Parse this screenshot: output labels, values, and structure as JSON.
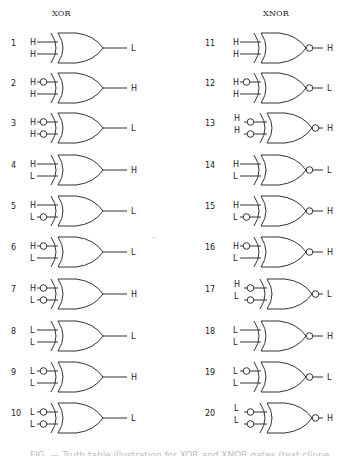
{
  "titles": {
    "left": "XOR",
    "right": "XNOR"
  },
  "style": {
    "stroke": "#333333",
    "text": "#222222"
  },
  "gates": [
    {
      "num": "1",
      "type": "XOR",
      "col": 0,
      "row": 0,
      "in1": "H",
      "in1_inv": false,
      "in2": "H",
      "in2_inv": false,
      "out": "L"
    },
    {
      "num": "2",
      "type": "XOR",
      "col": 0,
      "row": 1,
      "in1": "H",
      "in1_inv": true,
      "in2": "H",
      "in2_inv": false,
      "out": "H"
    },
    {
      "num": "3",
      "type": "XOR",
      "col": 0,
      "row": 2,
      "in1": "H",
      "in1_inv": true,
      "in2": "H",
      "in2_inv": true,
      "out": "L"
    },
    {
      "num": "4",
      "type": "XOR",
      "col": 0,
      "row": 3,
      "in1": "H",
      "in1_inv": false,
      "in2": "L",
      "in2_inv": false,
      "out": "H"
    },
    {
      "num": "5",
      "type": "XOR",
      "col": 0,
      "row": 4,
      "in1": "H",
      "in1_inv": false,
      "in2": "L",
      "in2_inv": true,
      "out": "L"
    },
    {
      "num": "6",
      "type": "XOR",
      "col": 0,
      "row": 5,
      "in1": "H",
      "in1_inv": true,
      "in2": "L",
      "in2_inv": false,
      "out": "L"
    },
    {
      "num": "7",
      "type": "XOR",
      "col": 0,
      "row": 6,
      "in1": "H",
      "in1_inv": true,
      "in2": "L",
      "in2_inv": true,
      "out": "H"
    },
    {
      "num": "8",
      "type": "XOR",
      "col": 0,
      "row": 7,
      "in1": "L",
      "in1_inv": false,
      "in2": "L",
      "in2_inv": false,
      "out": "L"
    },
    {
      "num": "9",
      "type": "XOR",
      "col": 0,
      "row": 8,
      "in1": "L",
      "in1_inv": true,
      "in2": "L",
      "in2_inv": false,
      "out": "H"
    },
    {
      "num": "10",
      "type": "XOR",
      "col": 0,
      "row": 9,
      "in1": "L",
      "in1_inv": true,
      "in2": "L",
      "in2_inv": true,
      "out": "L"
    },
    {
      "num": "11",
      "type": "XNOR",
      "col": 1,
      "row": 0,
      "in1": "H",
      "in1_inv": false,
      "in2": "H",
      "in2_inv": false,
      "out": "H"
    },
    {
      "num": "12",
      "type": "XNOR",
      "col": 1,
      "row": 1,
      "in1": "H",
      "in1_inv": true,
      "in2": "H",
      "in2_inv": false,
      "out": "L"
    },
    {
      "num": "13",
      "type": "XNOR",
      "col": 1,
      "row": 2,
      "in1": "H",
      "in1_inv": true,
      "in2": "H",
      "in2_inv": true,
      "out": "H",
      "shifted": true
    },
    {
      "num": "14",
      "type": "XNOR",
      "col": 1,
      "row": 3,
      "in1": "H",
      "in1_inv": false,
      "in2": "L",
      "in2_inv": false,
      "out": "L"
    },
    {
      "num": "15",
      "type": "XNOR",
      "col": 1,
      "row": 4,
      "in1": "H",
      "in1_inv": false,
      "in2": "L",
      "in2_inv": true,
      "out": "H"
    },
    {
      "num": "16",
      "type": "XNOR",
      "col": 1,
      "row": 5,
      "in1": "H",
      "in1_inv": true,
      "in2": "L",
      "in2_inv": false,
      "out": "H"
    },
    {
      "num": "17",
      "type": "XNOR",
      "col": 1,
      "row": 6,
      "in1": "H",
      "in1_inv": true,
      "in2": "L",
      "in2_inv": true,
      "out": "L",
      "shifted": true
    },
    {
      "num": "18",
      "type": "XNOR",
      "col": 1,
      "row": 7,
      "in1": "L",
      "in1_inv": false,
      "in2": "L",
      "in2_inv": false,
      "out": "H"
    },
    {
      "num": "19",
      "type": "XNOR",
      "col": 1,
      "row": 8,
      "in1": "L",
      "in1_inv": true,
      "in2": "L",
      "in2_inv": false,
      "out": "L"
    },
    {
      "num": "20",
      "type": "XNOR",
      "col": 1,
      "row": 9,
      "in1": "L",
      "in1_inv": true,
      "in2": "L",
      "in2_inv": true,
      "out": "H",
      "shifted": true
    }
  ],
  "caption": "FIG. — Truth table illustration for XOR and XNOR gates (text clipped)"
}
